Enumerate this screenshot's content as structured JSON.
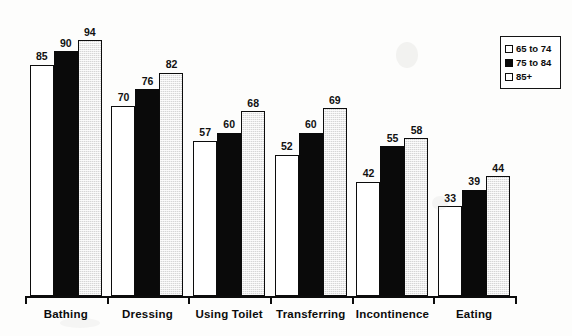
{
  "chart_data": {
    "type": "bar",
    "title": "",
    "xlabel": "",
    "ylabel": "",
    "ylim": [
      0,
      100
    ],
    "grid": false,
    "legend_position": "top-right",
    "categories": [
      "Bathing",
      "Dressing",
      "Using Toilet",
      "Transferring",
      "Incontinence",
      "Eating"
    ],
    "series": [
      {
        "name": "65 to 74",
        "color": "#ffffff",
        "values": [
          85,
          70,
          57,
          52,
          42,
          33
        ]
      },
      {
        "name": "75 to 84",
        "color": "#0a0a0a",
        "values": [
          90,
          76,
          60,
          60,
          55,
          39
        ]
      },
      {
        "name": "85+",
        "color": "#d6d6d6",
        "values": [
          94,
          82,
          68,
          69,
          58,
          44
        ]
      }
    ]
  },
  "legend": {
    "items": [
      {
        "label": "65 to 74",
        "swatch": "legend-swatch-white"
      },
      {
        "label": "75 to 84",
        "swatch": "legend-swatch-black"
      },
      {
        "label": "85+",
        "swatch": "legend-swatch-gray"
      }
    ]
  }
}
